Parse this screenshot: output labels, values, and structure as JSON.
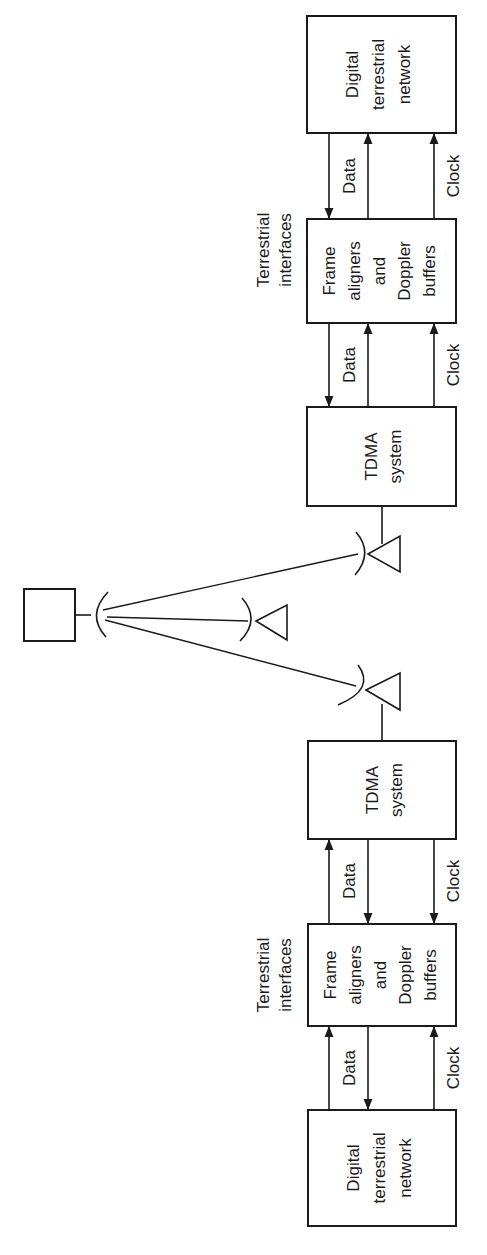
{
  "figure": {
    "orientation": "rotated-90-ccw",
    "colors": {
      "ink": "#1a1a1a",
      "background": "#ffffff"
    }
  },
  "earth_station_a": {
    "terrestrial_interfaces_label": [
      "Terrestrial",
      "interfaces"
    ],
    "network_box": [
      "Digital",
      "terrestrial",
      "network"
    ],
    "buffer_box": [
      "Frame",
      "aligners",
      "and",
      "Doppler",
      "buffers"
    ],
    "tdma_box": [
      "TDMA",
      "system"
    ],
    "link_labels": {
      "network_to_buffer_data": "Data",
      "network_to_buffer_clock": "Clock",
      "buffer_to_tdma_data": "Data",
      "buffer_to_tdma_clock": "Clock"
    }
  },
  "earth_station_b": {
    "terrestrial_interfaces_label": [
      "Terrestrial",
      "interfaces"
    ],
    "network_box": [
      "Digital",
      "terrestrial",
      "network"
    ],
    "buffer_box": [
      "Frame",
      "aligners",
      "and",
      "Doppler",
      "buffers"
    ],
    "tdma_box": [
      "TDMA",
      "system"
    ],
    "link_labels": {
      "tdma_to_buffer_data": "Data",
      "tdma_to_buffer_clock": "Clock",
      "buffer_to_network_data": "Data",
      "buffer_to_network_clock": "Clock"
    }
  },
  "satellite": {
    "icon": "satellite-box-with-dish",
    "antennas": [
      "earth-antenna-a",
      "earth-antenna-middle",
      "earth-antenna-b"
    ]
  }
}
